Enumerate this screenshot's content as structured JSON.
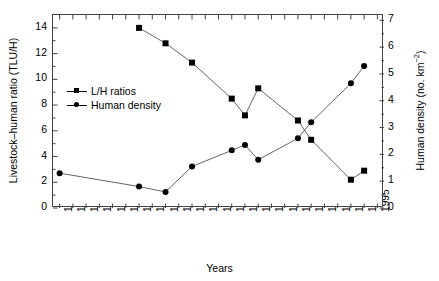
{
  "chart_data": {
    "type": "line",
    "title": "",
    "xlabel": "Years",
    "ylabel": "Livestock–human ratio (TLU/H)",
    "y2label": "Human density (no. km⁻²)",
    "grid": false,
    "legend_position": "inside-left",
    "x_tick_labels": [
      "1954",
      "1956",
      "1958",
      "1960",
      "1962",
      "1964",
      "1966",
      "1968",
      "1970",
      "1972",
      "1974",
      "1976",
      "1977",
      "1978",
      "1980",
      "1982",
      "1984",
      "1986",
      "1988",
      "1990",
      "1991",
      "1992",
      "1993",
      "1994",
      "1995"
    ],
    "ylim": [
      0,
      15
    ],
    "y_tick_labels": [
      "0",
      "2",
      "4",
      "6",
      "8",
      "10",
      "12",
      "14"
    ],
    "y2lim": [
      0,
      7.2
    ],
    "y2_tick_labels": [
      "0",
      "1",
      "2",
      "3",
      "4",
      "5",
      "6",
      "7"
    ],
    "series": [
      {
        "name": "L/H ratios",
        "marker": "square",
        "axis": "left",
        "points": [
          {
            "x": "1966",
            "y": 14.0
          },
          {
            "x": "1970",
            "y": 12.8
          },
          {
            "x": "1974",
            "y": 11.3
          },
          {
            "x": "1978",
            "y": 8.5
          },
          {
            "x": "1980",
            "y": 7.2
          },
          {
            "x": "1982",
            "y": 9.3
          },
          {
            "x": "1988",
            "y": 6.8
          },
          {
            "x": "1990",
            "y": 5.3
          },
          {
            "x": "1993",
            "y": 2.2
          },
          {
            "x": "1994",
            "y": 2.9
          }
        ]
      },
      {
        "name": "Human density",
        "marker": "circle",
        "axis": "right",
        "points": [
          {
            "x": "1954",
            "y": 1.3
          },
          {
            "x": "1966",
            "y": 0.8
          },
          {
            "x": "1970",
            "y": 0.6
          },
          {
            "x": "1974",
            "y": 1.55
          },
          {
            "x": "1978",
            "y": 2.15
          },
          {
            "x": "1980",
            "y": 2.35
          },
          {
            "x": "1982",
            "y": 1.8
          },
          {
            "x": "1988",
            "y": 2.6
          },
          {
            "x": "1990",
            "y": 3.2
          },
          {
            "x": "1993",
            "y": 4.65
          },
          {
            "x": "1994",
            "y": 5.3
          }
        ]
      }
    ]
  },
  "axes": {
    "left_title": "Livestock–human ratio (TLU/H)",
    "right_title_main": "Human density (no. km",
    "right_title_sup": "−2",
    "right_title_end": ")",
    "x_title": "Years"
  },
  "legend": {
    "items": [
      {
        "label": "L/H ratios",
        "marker": "square"
      },
      {
        "label": "Human density",
        "marker": "circle"
      }
    ]
  }
}
